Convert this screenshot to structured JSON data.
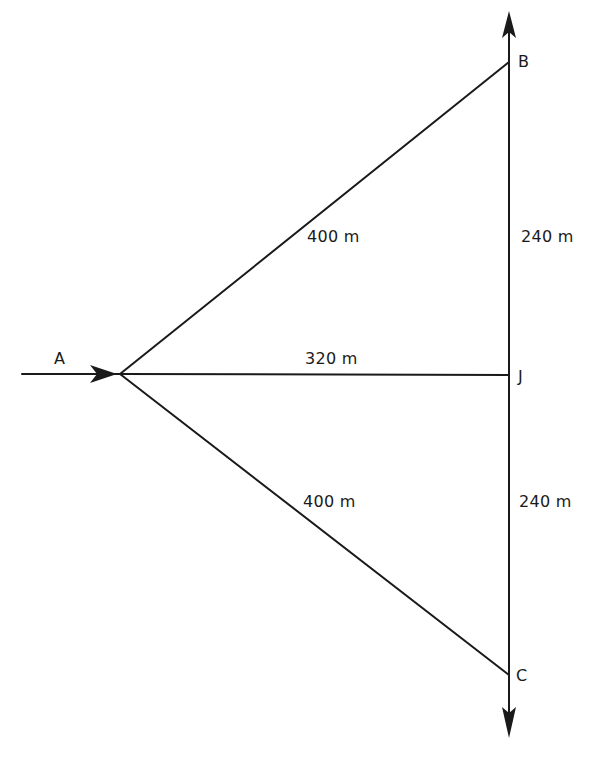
{
  "diagram": {
    "type": "network-path-diagram",
    "colors": {
      "line": "#1a1a1a",
      "background": "#ffffff"
    },
    "nodes": [
      {
        "id": "A",
        "label": "A"
      },
      {
        "id": "B",
        "label": "B"
      },
      {
        "id": "J",
        "label": "J"
      },
      {
        "id": "C",
        "label": "C"
      }
    ],
    "edges": [
      {
        "from": "junction",
        "to": "B",
        "length": "400 m"
      },
      {
        "from": "junction",
        "to": "J",
        "length": "320 m"
      },
      {
        "from": "junction",
        "to": "C",
        "length": "400 m"
      },
      {
        "from": "B",
        "to": "J",
        "length": "240 m"
      },
      {
        "from": "J",
        "to": "C",
        "length": "240 m"
      }
    ],
    "labels": {
      "node_a": "A",
      "node_b": "B",
      "node_j": "J",
      "node_c": "C",
      "len_upper_diagonal": "400 m",
      "len_horizontal": "320 m",
      "len_lower_diagonal": "400 m",
      "len_upper_vertical": "240 m",
      "len_lower_vertical": "240 m"
    },
    "arrows": [
      {
        "name": "inflow-arrow",
        "direction": "right",
        "at": "A"
      },
      {
        "name": "outflow-arrow-up",
        "direction": "up",
        "beyond": "B"
      },
      {
        "name": "outflow-arrow-down",
        "direction": "down",
        "beyond": "C"
      }
    ]
  }
}
